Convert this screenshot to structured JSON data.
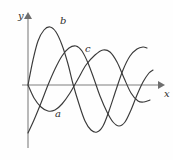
{
  "figure": {
    "background_color": "#fefefe",
    "curve_color": "#3a3a3a",
    "axis_color": "#a8a8a8",
    "axes": {
      "x_label": "x",
      "y_label": "y",
      "origin": [
        28,
        85
      ],
      "x_axis_from": [
        22,
        85
      ],
      "x_axis_to": [
        163,
        85
      ],
      "y_axis_from": [
        28,
        148
      ],
      "y_axis_to": [
        28,
        14
      ]
    },
    "curve_labels": [
      {
        "text": "a",
        "x": 55,
        "y": 109
      },
      {
        "text": "b",
        "x": 60,
        "y": 16
      },
      {
        "text": "c",
        "x": 85,
        "y": 44
      }
    ]
  },
  "chart_data": {
    "type": "line",
    "title": "",
    "xlabel": "x",
    "ylabel": "y",
    "grid": false,
    "legend": "inline-curve-labels",
    "axis_ranges": {
      "x": [
        -0.3,
        7.0
      ],
      "y": [
        -2.6,
        2.6
      ]
    },
    "series": [
      {
        "name": "a",
        "label": "a",
        "label_position": [
          55,
          109
        ],
        "points": [
          [
            28,
            85
          ],
          [
            34,
            98
          ],
          [
            41,
            107
          ],
          [
            48,
            111
          ],
          [
            55,
            110
          ],
          [
            62,
            104
          ],
          [
            70,
            93
          ],
          [
            78,
            79
          ],
          [
            86,
            65
          ],
          [
            95,
            55
          ],
          [
            103,
            50
          ],
          [
            110,
            52
          ],
          [
            117,
            62
          ],
          [
            124,
            78
          ],
          [
            131,
            93
          ],
          [
            138,
            101
          ],
          [
            144,
            102
          ],
          [
            150,
            100
          ]
        ]
      },
      {
        "name": "b",
        "label": "b",
        "label_position": [
          60,
          16
        ],
        "points": [
          [
            28,
            85
          ],
          [
            33,
            60
          ],
          [
            38,
            41
          ],
          [
            44,
            30
          ],
          [
            50,
            27
          ],
          [
            56,
            32
          ],
          [
            62,
            45
          ],
          [
            68,
            64
          ],
          [
            73,
            84
          ],
          [
            79,
            104
          ],
          [
            85,
            121
          ],
          [
            91,
            130
          ],
          [
            97,
            132
          ],
          [
            103,
            126
          ],
          [
            109,
            111
          ],
          [
            116,
            90
          ],
          [
            123,
            70
          ],
          [
            130,
            56
          ],
          [
            137,
            49
          ],
          [
            143,
            47
          ],
          [
            147,
            48
          ]
        ]
      },
      {
        "name": "c",
        "label": "c",
        "label_position": [
          85,
          44
        ],
        "points": [
          [
            28,
            133
          ],
          [
            34,
            120
          ],
          [
            41,
            103
          ],
          [
            48,
            85
          ],
          [
            55,
            69
          ],
          [
            62,
            56
          ],
          [
            69,
            48
          ],
          [
            76,
            46
          ],
          [
            82,
            51
          ],
          [
            88,
            63
          ],
          [
            94,
            79
          ],
          [
            100,
            96
          ],
          [
            107,
            112
          ],
          [
            113,
            122
          ],
          [
            119,
            126
          ],
          [
            125,
            122
          ],
          [
            131,
            110
          ],
          [
            137,
            95
          ],
          [
            143,
            82
          ],
          [
            149,
            73
          ],
          [
            153,
            70
          ]
        ]
      }
    ]
  }
}
